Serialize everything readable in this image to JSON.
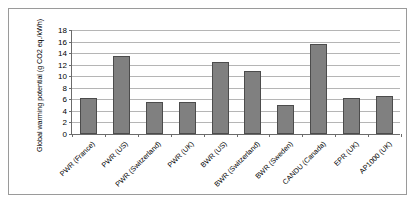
{
  "chart_data": {
    "type": "bar",
    "title": "",
    "xlabel": "",
    "ylabel": "Global warming potential (g CO2 eq./kWh)",
    "ylim": [
      0,
      18
    ],
    "yticks": [
      0,
      2,
      4,
      6,
      8,
      10,
      12,
      14,
      16,
      18
    ],
    "grid": true,
    "legend": "none",
    "bar_color": "#808080",
    "bar_border_color": "#4c4c4c",
    "gridline_color": "#b5b5b5",
    "axis_color": "#6b6b6b",
    "frame_color": "#9a9a9a",
    "categories": [
      "PWR (France)",
      "PWR (US)",
      "PWR (Switzerland)",
      "PWR (UK)",
      "BWR (US)",
      "BWR (Switzerland)",
      "BWR (Sweden)",
      "CANDU (Canada)",
      "EPR (UK)",
      "AP1000 (UK)"
    ],
    "values": [
      6.3,
      13.5,
      5.5,
      5.5,
      12.4,
      10.9,
      5.0,
      15.5,
      6.3,
      6.5
    ]
  }
}
